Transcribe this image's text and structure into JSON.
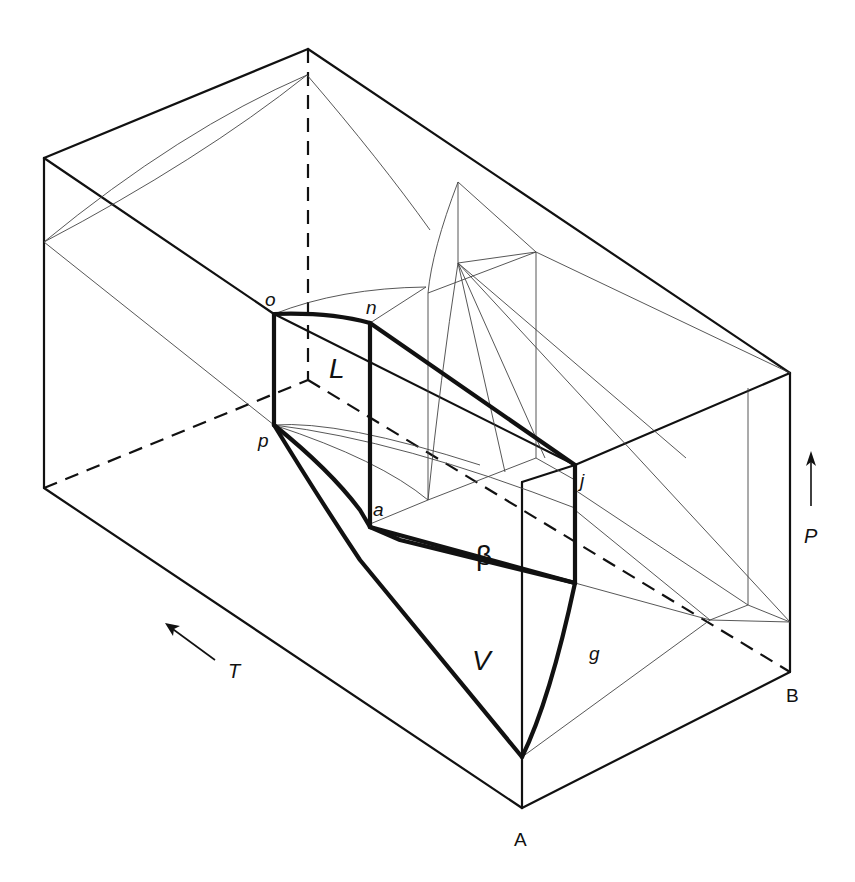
{
  "header": {
    "cropped_text": "phase diagram of a binary system"
  },
  "diagram": {
    "regions": {
      "liquid": "L",
      "beta": "β",
      "vapor": "V"
    },
    "points": {
      "o": "o",
      "n": "n",
      "p": "p",
      "a": "a",
      "j": "j",
      "g": "g"
    },
    "components": {
      "A": "A",
      "B": "B"
    },
    "axes": {
      "pressure": "P",
      "temperature": "T"
    }
  }
}
